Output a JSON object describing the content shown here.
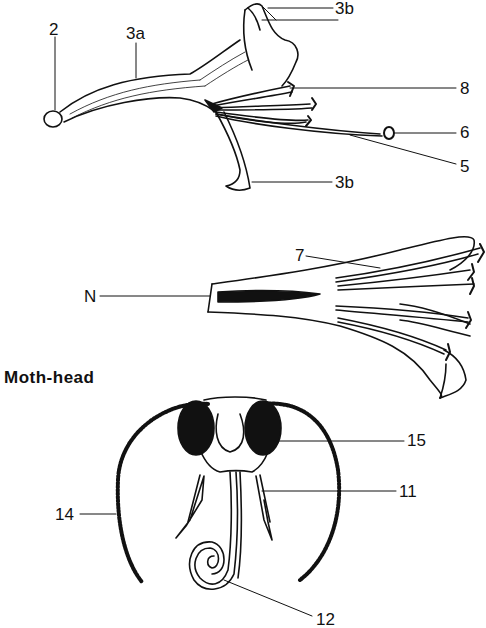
{
  "figure": {
    "section_title": "Moth-head",
    "flower_side_view": {
      "labels": {
        "stigma": "2",
        "corolla_tube": "3a",
        "upper_lip": "3b",
        "upper_lip_2": "3b",
        "lower_lip": "3b",
        "anther": "8",
        "stigma_tip": "6",
        "style": "5"
      }
    },
    "flower_section_view": {
      "labels": {
        "nectar": "N",
        "stamens": "7"
      }
    },
    "moth_head": {
      "labels": {
        "compound_eye": "15",
        "palp": "11",
        "antenna": "14",
        "proboscis": "12"
      }
    },
    "colors": {
      "ink": "#111111",
      "background": "#ffffff"
    }
  }
}
